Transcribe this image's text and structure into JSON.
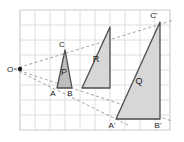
{
  "figure": {
    "background_color": "#ffffff",
    "grid": {
      "visible": true,
      "line_color": "#d5d5d5",
      "border_color": "#c9c9c9",
      "cell_size": 15,
      "x0": 20,
      "y0": 10,
      "cols": 10,
      "rows": 8
    },
    "style": {
      "triangle_fill": "#d7d7d7",
      "triangle_fill_dark": "#b8b8b8",
      "triangle_stroke": "#4d4d4d",
      "dashed_color": "#8c8c8c",
      "label_color": "#1a1a1a"
    },
    "centre": {
      "name": "O",
      "label": "O",
      "x": 14,
      "y": 69,
      "dot_radius": 2.2
    },
    "triangles": [
      {
        "name": "P",
        "label": "P",
        "label_x": 64,
        "label_y": 75,
        "fill": "#bdbdbd",
        "points": "57,88 72,88 65,50",
        "vertices": [
          {
            "label": "A",
            "x": 57,
            "y": 88,
            "label_x": 53,
            "label_y": 96
          },
          {
            "label": "B",
            "x": 72,
            "y": 88,
            "label_x": 70,
            "label_y": 96
          },
          {
            "label": "C",
            "x": 65,
            "y": 50,
            "label_x": 62,
            "label_y": 47
          }
        ]
      },
      {
        "name": "R",
        "label": "R",
        "label_x": 96,
        "label_y": 62,
        "fill": "#d7d7d7",
        "points": "82,88 110,88 110,27",
        "vertices": []
      },
      {
        "name": "Q",
        "label": "Q",
        "label_x": 139,
        "label_y": 84,
        "fill": "#d7d7d7",
        "points": "116,119 160,119 160,22",
        "vertices": [
          {
            "label": "A'",
            "x": 116,
            "y": 119,
            "label_x": 112,
            "label_y": 128
          },
          {
            "label": "B'",
            "x": 160,
            "y": 119,
            "label_x": 158,
            "label_y": 128
          },
          {
            "label": "C'",
            "x": 160,
            "y": 22,
            "label_x": 154,
            "label_y": 18
          }
        ]
      }
    ],
    "rays": [
      {
        "name": "ray-O-to-C-prime",
        "x1": 14,
        "y1": 69,
        "x2": 174,
        "y2": 20
      },
      {
        "name": "ray-O-to-B-prime",
        "x1": 14,
        "y1": 69,
        "x2": 172,
        "y2": 121
      },
      {
        "name": "ray-O-to-A-prime",
        "x1": 14,
        "y1": 69,
        "x2": 128,
        "y2": 125
      }
    ],
    "connectors": [
      {
        "name": "segment-A-prime-to-B-prime-dashed",
        "x1": 116,
        "y1": 119,
        "x2": 160,
        "y2": 119
      },
      {
        "name": "segment-A-prime-chord",
        "x1": 118,
        "y1": 112,
        "x2": 160,
        "y2": 119
      }
    ]
  }
}
